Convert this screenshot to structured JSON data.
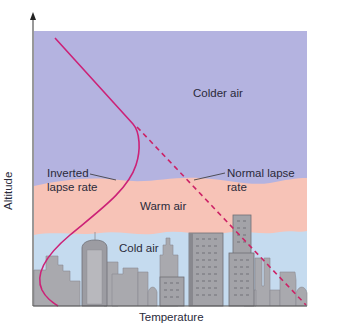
{
  "diagram": {
    "type": "temperature inversion diagram",
    "axes": {
      "x_label": "Temperature",
      "y_label": "Altitude"
    },
    "layers": [
      {
        "name": "Colder air",
        "color": "#b4b3e0"
      },
      {
        "name": "Warm air",
        "color": "#f7c3b7"
      },
      {
        "name": "Cold air",
        "color": "#c5dbef"
      }
    ],
    "lines": [
      {
        "name": "Inverted lapse rate",
        "style": "solid",
        "color": "#cc2277"
      },
      {
        "name": "Normal lapse rate",
        "style": "dashed",
        "color": "#cc2266"
      }
    ],
    "labels": {
      "colder_air": "Colder air",
      "warm_air": "Warm air",
      "cold_air": "Cold air",
      "inverted_line1": "Inverted",
      "inverted_line2": "lapse rate",
      "normal_line1": "Normal lapse",
      "normal_line2": "rate"
    },
    "colors": {
      "buildings": "#a8a8ac",
      "building_dark": "#7e7e84",
      "axis": "#333333"
    }
  }
}
